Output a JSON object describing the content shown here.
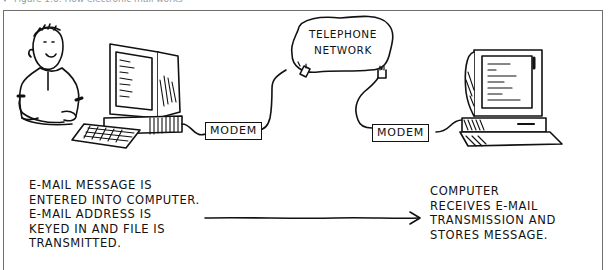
{
  "caption": {
    "text": "Figure 1.6: How electronic mail works"
  },
  "diagram": {
    "network": {
      "line1": "TELEPHONE",
      "line2": "NETWORK"
    },
    "modem_left": {
      "label": "MODEM"
    },
    "modem_right": {
      "label": "MODEM"
    },
    "sender_text": [
      "E-MAIL MESSAGE IS",
      "ENTERED INTO COMPUTER.",
      "E-MAIL ADDRESS IS",
      "KEYED IN AND FILE IS",
      "TRANSMITTED."
    ],
    "receiver_text": [
      "COMPUTER",
      "RECEIVES E-MAIL",
      "TRANSMISSION AND",
      "STORES MESSAGE."
    ],
    "flow": {
      "from": "sender",
      "to": "receiver",
      "direction": "left-to-right"
    }
  }
}
